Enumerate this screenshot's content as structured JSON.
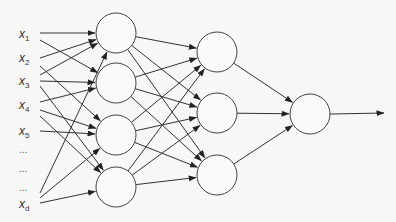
{
  "diagram": {
    "type": "feed-forward neural network",
    "inputs": [
      {
        "label": "x",
        "sub": "1",
        "y": 36
      },
      {
        "label": "x",
        "sub": "2",
        "y": 60
      },
      {
        "label": "x",
        "sub": "3",
        "y": 83
      },
      {
        "label": "x",
        "sub": "4",
        "y": 107
      },
      {
        "label": "x",
        "sub": "5",
        "y": 133
      },
      {
        "label": "x",
        "sub": "d",
        "y": 206
      }
    ],
    "ellipsis": [
      "...",
      "...",
      "..."
    ],
    "layers": {
      "hidden1": [
        [
          116,
          33
        ],
        [
          116,
          83
        ],
        [
          116,
          135
        ],
        [
          116,
          187
        ]
      ],
      "hidden2": [
        [
          217,
          52
        ],
        [
          217,
          113
        ],
        [
          217,
          175
        ]
      ],
      "output": [
        [
          310,
          114
        ]
      ]
    },
    "radius": 20,
    "colors": {
      "stroke": "#333333",
      "background": "#f7f7f5"
    }
  }
}
